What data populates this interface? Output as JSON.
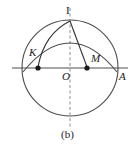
{
  "figure": {
    "caption": "(b)",
    "labels": {
      "top_point": "I",
      "left_point": "K",
      "right_point": "M",
      "center": "O",
      "axis_end": "A"
    },
    "colors": {
      "stroke": "#4d4d4d",
      "dark_stroke": "#333333",
      "point_fill": "#1a1a1a",
      "text": "#1a1a1a",
      "background": "#ffffff"
    },
    "geometry": {
      "circle": {
        "cx": 70,
        "cy": 68,
        "r": 48
      },
      "points": {
        "I": {
          "x": 70,
          "y": 20
        },
        "K": {
          "x": 38,
          "y": 68
        },
        "M": {
          "x": 87,
          "y": 68
        },
        "O": {
          "x": 70,
          "y": 68
        },
        "A": {
          "x": 118,
          "y": 68
        }
      },
      "horizontal_axis": {
        "x1": 12,
        "y1": 68,
        "x2": 128,
        "y2": 68
      },
      "vertical_axis": {
        "x1": 70,
        "y1": 8,
        "x2": 70,
        "y2": 128,
        "dashed": true
      }
    }
  }
}
